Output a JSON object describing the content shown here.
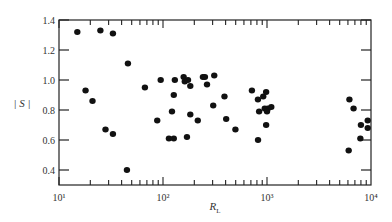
{
  "chart_data": {
    "type": "scatter",
    "title": "",
    "xlabel": "R_L",
    "ylabel": "|S|",
    "xscale": "log",
    "xlim": [
      10,
      10000
    ],
    "ylim": [
      0.3,
      1.4
    ],
    "x_ticks": [
      10,
      100,
      1000,
      10000
    ],
    "x_tick_labels": [
      "10¹",
      "10²",
      "10³",
      "10⁴"
    ],
    "y_ticks": [
      0.4,
      0.6,
      0.8,
      1.0,
      1.2,
      1.4
    ],
    "y_tick_labels": [
      "0.4",
      "0.6",
      "0.8",
      "1.0",
      "1.2",
      "1.4"
    ],
    "grid": false,
    "legend": null,
    "marker_color": "#111111",
    "series": [
      {
        "name": "|S|",
        "points": [
          [
            15,
            1.32
          ],
          [
            25,
            1.33
          ],
          [
            33,
            1.31
          ],
          [
            46,
            1.11
          ],
          [
            18,
            0.93
          ],
          [
            21,
            0.86
          ],
          [
            28,
            0.67
          ],
          [
            33,
            0.64
          ],
          [
            45,
            0.4
          ],
          [
            67,
            0.95
          ],
          [
            88,
            0.73
          ],
          [
            95,
            1.0
          ],
          [
            130,
            1.0
          ],
          [
            122,
            0.79
          ],
          [
            127,
            0.9
          ],
          [
            158,
            1.02
          ],
          [
            162,
            0.99
          ],
          [
            174,
            1.0
          ],
          [
            183,
            0.96
          ],
          [
            183,
            0.77
          ],
          [
            114,
            0.61
          ],
          [
            127,
            0.61
          ],
          [
            170,
            0.62
          ],
          [
            216,
            0.73
          ],
          [
            242,
            1.02
          ],
          [
            253,
            1.02
          ],
          [
            265,
            0.97
          ],
          [
            311,
            1.03
          ],
          [
            304,
            0.83
          ],
          [
            390,
            0.89
          ],
          [
            405,
            0.74
          ],
          [
            497,
            0.67
          ],
          [
            716,
            0.93
          ],
          [
            818,
            0.87
          ],
          [
            920,
            0.89
          ],
          [
            981,
            0.92
          ],
          [
            951,
            0.81
          ],
          [
            1020,
            0.81
          ],
          [
            1100,
            0.82
          ],
          [
            1000,
            0.79
          ],
          [
            840,
            0.79
          ],
          [
            981,
            0.7
          ],
          [
            820,
            0.6
          ],
          [
            6200,
            0.87
          ],
          [
            6800,
            0.81
          ],
          [
            6100,
            0.53
          ],
          [
            8000,
            0.7
          ],
          [
            7900,
            0.61
          ],
          [
            9300,
            0.73
          ],
          [
            9300,
            0.68
          ]
        ]
      }
    ]
  }
}
